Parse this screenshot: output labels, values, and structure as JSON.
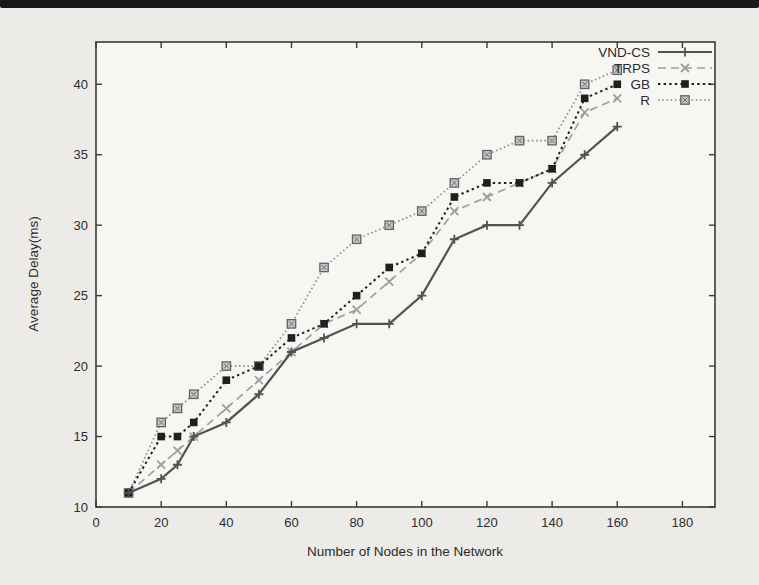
{
  "figure": {
    "kind": "scanned-plot",
    "frame_color": "#3a3a3a",
    "plot_bg": "#f7f6f3",
    "paper_bg": "#edebe7"
  },
  "chart_data": {
    "type": "line",
    "title": "",
    "xlabel": "Number of Nodes in the Network",
    "ylabel": "Average Delay(ms)",
    "xlim": [
      0,
      190
    ],
    "ylim": [
      10,
      43
    ],
    "xticks": [
      0,
      20,
      40,
      60,
      80,
      100,
      120,
      140,
      160,
      180
    ],
    "yticks": [
      10,
      15,
      20,
      25,
      30,
      35,
      40
    ],
    "grid": false,
    "legend_position": "top-right-inside",
    "x": [
      10,
      20,
      25,
      30,
      40,
      50,
      60,
      70,
      80,
      90,
      100,
      110,
      120,
      130,
      140,
      150,
      160
    ],
    "series": [
      {
        "name": "VND-CS",
        "marker": "plus",
        "line": "solid",
        "color": "#525252",
        "values": [
          11,
          12,
          13,
          15,
          16,
          18,
          21,
          22,
          23,
          23,
          25,
          29,
          30,
          30,
          33,
          35,
          37
        ]
      },
      {
        "name": "TRPS",
        "marker": "cross",
        "line": "dashed",
        "color": "#9f9f9f",
        "values": [
          11,
          13,
          14,
          15,
          17,
          19,
          21,
          23,
          24,
          26,
          28,
          31,
          32,
          33,
          34,
          38,
          39
        ]
      },
      {
        "name": "GB",
        "marker": "filled-square",
        "line": "dotted",
        "color": "#1f1f1f",
        "values": [
          11,
          15,
          15,
          16,
          19,
          20,
          22,
          23,
          25,
          27,
          28,
          32,
          33,
          33,
          34,
          39,
          40
        ]
      },
      {
        "name": "R",
        "marker": "open-square",
        "line": "fine-dot",
        "color": "#8e8e8e",
        "values": [
          11,
          16,
          17,
          18,
          20,
          20,
          23,
          27,
          29,
          30,
          31,
          33,
          35,
          36,
          36,
          40,
          41
        ]
      }
    ]
  }
}
